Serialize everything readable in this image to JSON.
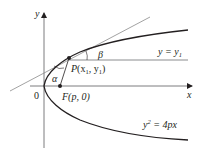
{
  "diagram": {
    "type": "parabola-reflection",
    "axes": {
      "x_label": "x",
      "y_label": "y",
      "origin_label": "0"
    },
    "points": {
      "P": {
        "label_name": "P",
        "label_coords": "(x",
        "sub1": "1",
        "comma": ", y",
        "sub2": "1",
        "close": ")"
      },
      "F": {
        "label": "F(p, 0)"
      }
    },
    "angles": {
      "alpha": "α",
      "beta": "β"
    },
    "curves": {
      "parabola": {
        "lhs": "y",
        "exp": "2",
        "rhs": " = 4px"
      },
      "horizontal_line": {
        "lhs": "y = y",
        "sub": "1"
      }
    },
    "colors": {
      "ink": "#231f20",
      "tangent": "#8a8a8a",
      "axis": "#6d6e71"
    }
  }
}
